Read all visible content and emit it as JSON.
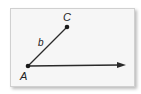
{
  "diagram": {
    "type": "angle",
    "points": {
      "A": {
        "label": "A",
        "x": 28,
        "y": 66
      },
      "C": {
        "label": "C",
        "x": 67,
        "y": 27
      }
    },
    "segments": [
      {
        "from": "A",
        "to": "C",
        "label": "b"
      }
    ],
    "rays": [
      {
        "from": "A",
        "direction": "right",
        "end_x": 126,
        "end_y": 65
      }
    ],
    "colors": {
      "line": "#2a2a2a",
      "background": "#f6f6f6",
      "border": "#d0d0d0"
    }
  }
}
